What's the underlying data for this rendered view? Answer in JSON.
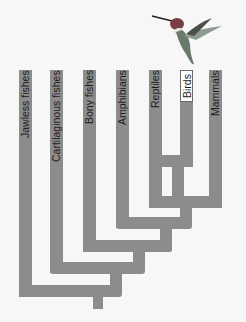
{
  "diagram": {
    "type": "cladogram",
    "taxa": [
      {
        "label": "Jawless fishes",
        "highlighted": false
      },
      {
        "label": "Cartilaginous fishes",
        "highlighted": false
      },
      {
        "label": "Bony fishes",
        "highlighted": false
      },
      {
        "label": "Amphibians",
        "highlighted": false
      },
      {
        "label": "Reptiles",
        "highlighted": false
      },
      {
        "label": "Birds",
        "highlighted": true
      },
      {
        "label": "Mammals",
        "highlighted": false
      }
    ],
    "illustration": "hummingbird",
    "colors": {
      "branch": "#8c8c8c",
      "background": "#f7f7f7",
      "highlight_box": "#ffffff",
      "text": "#1c1c1c"
    }
  }
}
